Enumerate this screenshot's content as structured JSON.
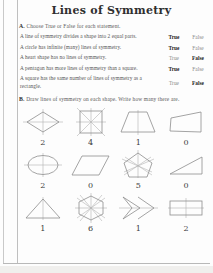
{
  "worksheet": {
    "title": "Lines of Symmetry",
    "section_a": {
      "marker": "A.",
      "instruction": "Choose True or False for each statement.",
      "option_true": "True",
      "option_false": "False",
      "rows": [
        {
          "statement": "A line of symmetry divides a shape into 2 equal parts.",
          "answer": "True"
        },
        {
          "statement": "A circle has infinite (many) lines of symmetry.",
          "answer": "True"
        },
        {
          "statement": "A heart shape has no lines of symmetry.",
          "answer": "False"
        },
        {
          "statement": "A pentagon has more lines of symmetry than a square.",
          "answer": "True"
        },
        {
          "statement": "A square has the same number of lines of symmetry as a rectangle.",
          "answer": "False"
        }
      ]
    },
    "section_b": {
      "marker": "B.",
      "instruction": "Draw lines of symmetry on each shape. Write how many there are.",
      "shapes": [
        {
          "name": "rhombus",
          "answer": "2"
        },
        {
          "name": "square",
          "answer": "4"
        },
        {
          "name": "trapezoid",
          "answer": "1"
        },
        {
          "name": "irregular-quadrilateral",
          "answer": "0"
        },
        {
          "name": "ellipse",
          "answer": "2"
        },
        {
          "name": "parallelogram",
          "answer": "0"
        },
        {
          "name": "pentagon",
          "answer": "5"
        },
        {
          "name": "right-triangle",
          "answer": "0"
        },
        {
          "name": "isosceles-triangle",
          "answer": "1"
        },
        {
          "name": "hexagon",
          "answer": "6"
        },
        {
          "name": "chevron-arrow",
          "answer": "1"
        },
        {
          "name": "rectangle",
          "answer": "2"
        }
      ]
    },
    "colors": {
      "ink": "#3a3a3a",
      "shape_stroke": "#8d8d8d",
      "symmetry_line": "#b0b0b0",
      "paper": "#fdfdfd"
    }
  }
}
